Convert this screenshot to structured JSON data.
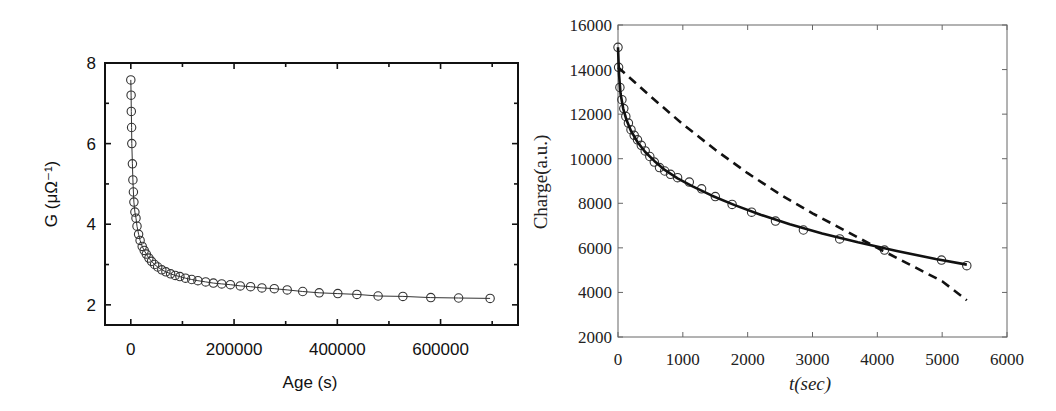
{
  "chart_data": [
    {
      "type": "scatter",
      "panel": "left",
      "title": "",
      "xlabel": "Age (s)",
      "ylabel": "G (μΩ⁻¹)",
      "xlim": [
        -50000,
        750000
      ],
      "ylim": [
        1.5,
        8
      ],
      "xticks": [
        0,
        200000,
        400000,
        600000
      ],
      "xtick_labels": [
        "0",
        "200000",
        "400000",
        "600000"
      ],
      "xminor": [
        100000,
        300000,
        500000,
        700000
      ],
      "yticks": [
        2,
        4,
        6,
        8
      ],
      "ytick_labels": [
        "2",
        "4",
        "6",
        "8"
      ],
      "yminor": [
        3,
        5,
        7
      ],
      "grid": false,
      "legend": null,
      "series": [
        {
          "name": "G measured (circles with connecting line)",
          "marker": "open-circle",
          "line": "thin-solid",
          "x": [
            0,
            500,
            1000,
            1500,
            2000,
            3000,
            4000,
            5000,
            6000,
            8000,
            10000,
            12000,
            15000,
            18000,
            22000,
            26000,
            30000,
            35000,
            40000,
            46000,
            52000,
            60000,
            68000,
            77000,
            86000,
            95000,
            106000,
            118000,
            130000,
            145000,
            160000,
            176000,
            193000,
            212000,
            232000,
            254000,
            278000,
            303000,
            333000,
            365000,
            401000,
            438000,
            479000,
            527000,
            581000,
            635000,
            696000
          ],
          "y": [
            7.58,
            7.2,
            6.8,
            6.4,
            6.0,
            5.5,
            5.1,
            4.8,
            4.55,
            4.3,
            4.15,
            3.95,
            3.75,
            3.6,
            3.45,
            3.35,
            3.26,
            3.16,
            3.08,
            3.0,
            2.94,
            2.87,
            2.82,
            2.77,
            2.73,
            2.7,
            2.66,
            2.63,
            2.6,
            2.57,
            2.54,
            2.52,
            2.5,
            2.47,
            2.45,
            2.42,
            2.4,
            2.37,
            2.33,
            2.3,
            2.28,
            2.26,
            2.22,
            2.21,
            2.18,
            2.17,
            2.16
          ]
        }
      ]
    },
    {
      "type": "line",
      "panel": "right",
      "title": "",
      "xlabel": "t(sec)",
      "ylabel": "Charge(a.u.)",
      "xlim": [
        0,
        6000
      ],
      "ylim": [
        2000,
        16000
      ],
      "xticks": [
        0,
        1000,
        2000,
        3000,
        4000,
        5000,
        6000
      ],
      "xtick_labels": [
        "0",
        "1000",
        "2000",
        "3000",
        "4000",
        "5000",
        "6000"
      ],
      "yticks": [
        2000,
        4000,
        6000,
        8000,
        10000,
        12000,
        14000,
        16000
      ],
      "ytick_labels": [
        "2000",
        "4000",
        "6000",
        "8000",
        "10000",
        "12000",
        "14000",
        "16000"
      ],
      "grid": false,
      "legend": null,
      "series": [
        {
          "name": "Measured charge",
          "marker": "open-circle",
          "line": "none",
          "x": [
            0,
            10,
            30,
            60,
            90,
            120,
            160,
            200,
            250,
            300,
            360,
            420,
            490,
            560,
            640,
            720,
            810,
            920,
            1100,
            1290,
            1500,
            1760,
            2060,
            2430,
            2860,
            3420,
            4110,
            4990,
            5380
          ],
          "y": [
            15000,
            14100,
            13200,
            12650,
            12250,
            11900,
            11600,
            11300,
            11050,
            10850,
            10600,
            10350,
            10100,
            9850,
            9600,
            9450,
            9300,
            9150,
            8950,
            8650,
            8300,
            7950,
            7600,
            7200,
            6800,
            6400,
            5900,
            5450,
            5200
          ]
        },
        {
          "name": "Fit (solid)",
          "marker": "none",
          "line": "thick-solid",
          "x": [
            0,
            15,
            40,
            80,
            130,
            200,
            300,
            420,
            560,
            720,
            920,
            1150,
            1450,
            1800,
            2200,
            2650,
            3150,
            3700,
            4300,
            4900,
            5380
          ],
          "y": [
            15000,
            13800,
            12900,
            12250,
            11750,
            11250,
            10750,
            10300,
            9900,
            9500,
            9120,
            8760,
            8340,
            7920,
            7490,
            7060,
            6650,
            6250,
            5860,
            5500,
            5250
          ]
        },
        {
          "name": "Fit (dashed)",
          "marker": "none",
          "line": "dashed",
          "x": [
            0,
            500,
            1000,
            1500,
            2000,
            2500,
            3000,
            3500,
            4000,
            4500,
            5000,
            5380
          ],
          "y": [
            14100,
            12800,
            11550,
            10400,
            9350,
            8400,
            7550,
            6780,
            6000,
            5250,
            4500,
            3650
          ]
        }
      ]
    }
  ]
}
